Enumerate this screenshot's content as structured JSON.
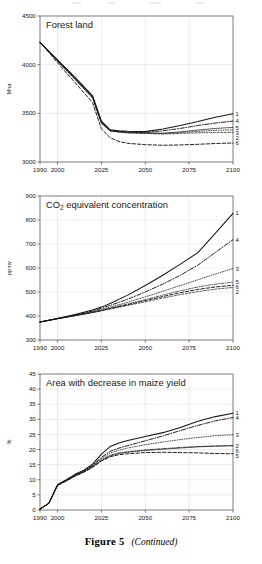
{
  "figure": {
    "caption_label": "Figure 5",
    "caption_note": "(Continued)"
  },
  "panels": [
    {
      "id": "forest-land",
      "title": "Forest land",
      "title_sub": "",
      "title_tail": "",
      "ylabel": "Mha",
      "xlabel": "",
      "ytick_labels": [
        "3000",
        "3500",
        "4000",
        "4500"
      ],
      "xtick_labels": [
        "1990",
        "2000",
        "2025",
        "2050",
        "2075",
        "2100"
      ],
      "legend": [
        {
          "label": "1",
          "value": 3495
        },
        {
          "label": "4",
          "value": 3420
        },
        {
          "label": "5",
          "value": 3355
        },
        {
          "label": "3",
          "value": 3330
        },
        {
          "label": "2",
          "value": 3305
        },
        {
          "label": "6",
          "value": 3195
        }
      ]
    },
    {
      "id": "co2-equivalent-concentration",
      "title": "CO",
      "title_sub": "2",
      "title_tail": " equivalent concentration",
      "ylabel": "ppmv",
      "xlabel": "",
      "ytick_labels": [
        "300",
        "400",
        "500",
        "600",
        "700",
        "800",
        "900"
      ],
      "xtick_labels": [
        "1990",
        "2000",
        "2025",
        "2050",
        "2075",
        "2100"
      ],
      "legend": [
        {
          "label": "1",
          "value": 828
        },
        {
          "label": "4",
          "value": 718
        },
        {
          "label": "3",
          "value": 598
        },
        {
          "label": "5",
          "value": 541
        },
        {
          "label": "6",
          "value": 528
        },
        {
          "label": "2",
          "value": 519
        }
      ]
    },
    {
      "id": "area-with-decrease-in-maize-yield",
      "title": "Area with decrease in maize yield",
      "title_sub": "",
      "title_tail": "",
      "ylabel": "%",
      "xlabel": "",
      "ytick_labels": [
        "0",
        "5",
        "10",
        "15",
        "20",
        "25",
        "30",
        "35",
        "40",
        "45"
      ],
      "xtick_labels": [
        "1990",
        "2000",
        "2025",
        "2050",
        "2075",
        "2100"
      ],
      "legend": [
        {
          "label": "1",
          "value": 32.0
        },
        {
          "label": "4",
          "value": 30.6
        },
        {
          "label": "3",
          "value": 24.9
        },
        {
          "label": "2",
          "value": 21.3
        },
        {
          "label": "6",
          "value": 21.3
        },
        {
          "label": "5",
          "value": 18.6
        }
      ]
    }
  ],
  "chart_data": [
    {
      "type": "line",
      "title": "Forest land",
      "xlabel": "",
      "ylabel": "Mha",
      "xlim": [
        1990,
        2100
      ],
      "ylim": [
        3000,
        4500
      ],
      "yticks": [
        3000,
        3500,
        4000,
        4500
      ],
      "xticks": [
        1990,
        2000,
        2025,
        2050,
        2075,
        2100
      ],
      "grid": true,
      "legend_position": "right-outside",
      "x": [
        1990,
        2000,
        2010,
        2020,
        2025,
        2030,
        2035,
        2040,
        2050,
        2060,
        2070,
        2080,
        2090,
        2100
      ],
      "series": [
        {
          "name": "1",
          "style": "solid",
          "values": [
            4230,
            4050,
            3870,
            3680,
            3420,
            3330,
            3320,
            3315,
            3312,
            3340,
            3375,
            3415,
            3460,
            3495
          ]
        },
        {
          "name": "4",
          "style": "dashdot",
          "values": [
            4230,
            4045,
            3862,
            3672,
            3410,
            3325,
            3315,
            3308,
            3305,
            3320,
            3345,
            3375,
            3400,
            3420
          ]
        },
        {
          "name": "5",
          "style": "solid-thin",
          "values": [
            4230,
            4040,
            3855,
            3665,
            3405,
            3322,
            3312,
            3305,
            3300,
            3296,
            3310,
            3328,
            3345,
            3355
          ]
        },
        {
          "name": "3",
          "style": "dotted",
          "values": [
            4230,
            4038,
            3850,
            3660,
            3400,
            3320,
            3310,
            3302,
            3296,
            3292,
            3302,
            3315,
            3325,
            3330
          ]
        },
        {
          "name": "2",
          "style": "dashed-fine",
          "values": [
            4230,
            4035,
            3846,
            3655,
            3398,
            3318,
            3306,
            3298,
            3292,
            3288,
            3294,
            3300,
            3303,
            3305
          ]
        },
        {
          "name": "6",
          "style": "dashed",
          "values": [
            4230,
            4020,
            3815,
            3610,
            3340,
            3250,
            3210,
            3192,
            3178,
            3172,
            3175,
            3182,
            3190,
            3195
          ]
        }
      ]
    },
    {
      "type": "line",
      "title": "CO2 equivalent concentration",
      "xlabel": "",
      "ylabel": "ppmv",
      "xlim": [
        1990,
        2100
      ],
      "ylim": [
        300,
        900
      ],
      "yticks": [
        300,
        400,
        500,
        600,
        700,
        800,
        900
      ],
      "xticks": [
        1990,
        2000,
        2025,
        2050,
        2075,
        2100
      ],
      "grid": true,
      "legend_position": "right-outside",
      "x": [
        1990,
        2000,
        2010,
        2020,
        2025,
        2030,
        2040,
        2050,
        2060,
        2070,
        2080,
        2090,
        2100
      ],
      "series": [
        {
          "name": "1",
          "style": "solid",
          "values": [
            375,
            390,
            406,
            425,
            437,
            452,
            487,
            527,
            570,
            616,
            664,
            745,
            828
          ]
        },
        {
          "name": "4",
          "style": "dashdot",
          "values": [
            375,
            390,
            404,
            421,
            432,
            444,
            470,
            500,
            533,
            570,
            612,
            665,
            718
          ]
        },
        {
          "name": "3",
          "style": "dotted",
          "values": [
            375,
            389,
            403,
            418,
            427,
            437,
            457,
            480,
            503,
            527,
            551,
            575,
            598
          ]
        },
        {
          "name": "5",
          "style": "dashdot-fine",
          "values": [
            375,
            389,
            402,
            416,
            424,
            433,
            450,
            468,
            487,
            505,
            521,
            533,
            541
          ]
        },
        {
          "name": "6",
          "style": "dashed",
          "values": [
            375,
            389,
            402,
            415,
            423,
            431,
            447,
            464,
            481,
            497,
            511,
            521,
            528
          ]
        },
        {
          "name": "2",
          "style": "dashed-fine",
          "values": [
            375,
            388,
            401,
            414,
            421,
            429,
            444,
            459,
            475,
            489,
            502,
            512,
            519
          ]
        }
      ]
    },
    {
      "type": "line",
      "title": "Area with decrease in maize yield",
      "xlabel": "",
      "ylabel": "%",
      "xlim": [
        1990,
        2100
      ],
      "ylim": [
        0,
        45
      ],
      "yticks": [
        0,
        5,
        10,
        15,
        20,
        25,
        30,
        35,
        40,
        45
      ],
      "xticks": [
        1990,
        2000,
        2025,
        2050,
        2075,
        2100
      ],
      "grid": true,
      "legend_position": "right-outside",
      "x": [
        1990,
        1995,
        2000,
        2005,
        2010,
        2015,
        2020,
        2025,
        2030,
        2035,
        2040,
        2050,
        2060,
        2070,
        2080,
        2090,
        2100
      ],
      "series": [
        {
          "name": "1",
          "style": "solid",
          "values": [
            0.3,
            2.2,
            8.4,
            10.0,
            11.8,
            13.2,
            15.2,
            18.5,
            21.0,
            22.2,
            23.0,
            24.3,
            25.6,
            27.3,
            29.4,
            30.9,
            32.0
          ]
        },
        {
          "name": "4",
          "style": "dashdot",
          "values": [
            0.3,
            2.2,
            8.3,
            9.9,
            11.6,
            13.0,
            14.8,
            17.4,
            19.4,
            20.5,
            21.3,
            22.9,
            24.5,
            26.3,
            28.0,
            29.5,
            30.6
          ]
        },
        {
          "name": "3",
          "style": "dotted",
          "values": [
            0.3,
            2.2,
            8.3,
            9.8,
            11.5,
            12.9,
            14.6,
            17.0,
            18.8,
            19.8,
            20.5,
            21.6,
            22.5,
            23.3,
            24.0,
            24.6,
            24.9
          ]
        },
        {
          "name": "2",
          "style": "dashdot-fine",
          "values": [
            0.3,
            2.2,
            8.2,
            9.7,
            11.4,
            12.7,
            14.4,
            16.6,
            18.1,
            18.9,
            19.3,
            19.9,
            20.3,
            20.7,
            21.0,
            21.2,
            21.3
          ]
        },
        {
          "name": "6",
          "style": "solid-thin",
          "values": [
            0.3,
            2.2,
            8.2,
            9.7,
            11.3,
            12.6,
            14.3,
            16.4,
            17.9,
            18.7,
            19.1,
            19.7,
            20.1,
            20.5,
            20.9,
            21.1,
            21.3
          ]
        },
        {
          "name": "5",
          "style": "dashed",
          "values": [
            0.3,
            2.2,
            8.1,
            9.6,
            11.2,
            12.5,
            14.1,
            16.2,
            17.6,
            18.3,
            18.6,
            19.0,
            19.1,
            19.0,
            18.9,
            18.7,
            18.6
          ]
        }
      ]
    }
  ]
}
